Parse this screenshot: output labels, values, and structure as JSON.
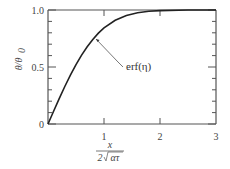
{
  "chart_data": {
    "type": "line",
    "title": "",
    "xlabel": "x / (2√(ατ))",
    "ylabel": "θ/θ₀",
    "xlim": [
      0,
      3
    ],
    "ylim": [
      0,
      1.0
    ],
    "grid": false,
    "legend": null,
    "x_ticks": [
      0,
      1,
      2,
      3
    ],
    "x_tick_labels": [
      "0",
      "1",
      "2",
      "3"
    ],
    "y_ticks": [
      0,
      0.5,
      1.0
    ],
    "y_tick_labels": [
      "0",
      "0.5",
      "1.0"
    ],
    "y_minor_ticks": [
      0.1,
      0.2,
      0.3,
      0.4,
      0.6,
      0.7,
      0.8,
      0.9
    ],
    "series": [
      {
        "name": "erf(η)",
        "x": [
          0,
          0.1,
          0.2,
          0.3,
          0.4,
          0.5,
          0.6,
          0.7,
          0.8,
          0.9,
          1.0,
          1.2,
          1.4,
          1.6,
          1.8,
          2.0,
          2.5,
          3.0
        ],
        "values": [
          0,
          0.112,
          0.223,
          0.329,
          0.428,
          0.52,
          0.604,
          0.678,
          0.742,
          0.797,
          0.843,
          0.91,
          0.952,
          0.976,
          0.989,
          0.995,
          1.0,
          1.0
        ]
      }
    ],
    "annotations": [
      {
        "text": "erf(η)",
        "arrow_to": [
          0.85,
          0.77
        ]
      }
    ]
  },
  "labels": {
    "y_axis": "θ/θ",
    "y_axis_sub": "0",
    "x_num": "x",
    "x_den_coef": "2",
    "x_den_rad": "ατ",
    "annotation": "erf(η)",
    "x0": "0",
    "x1": "1",
    "x2": "2",
    "x3": "3",
    "y0": "0",
    "y05": "0.5",
    "y10": "1.0"
  }
}
